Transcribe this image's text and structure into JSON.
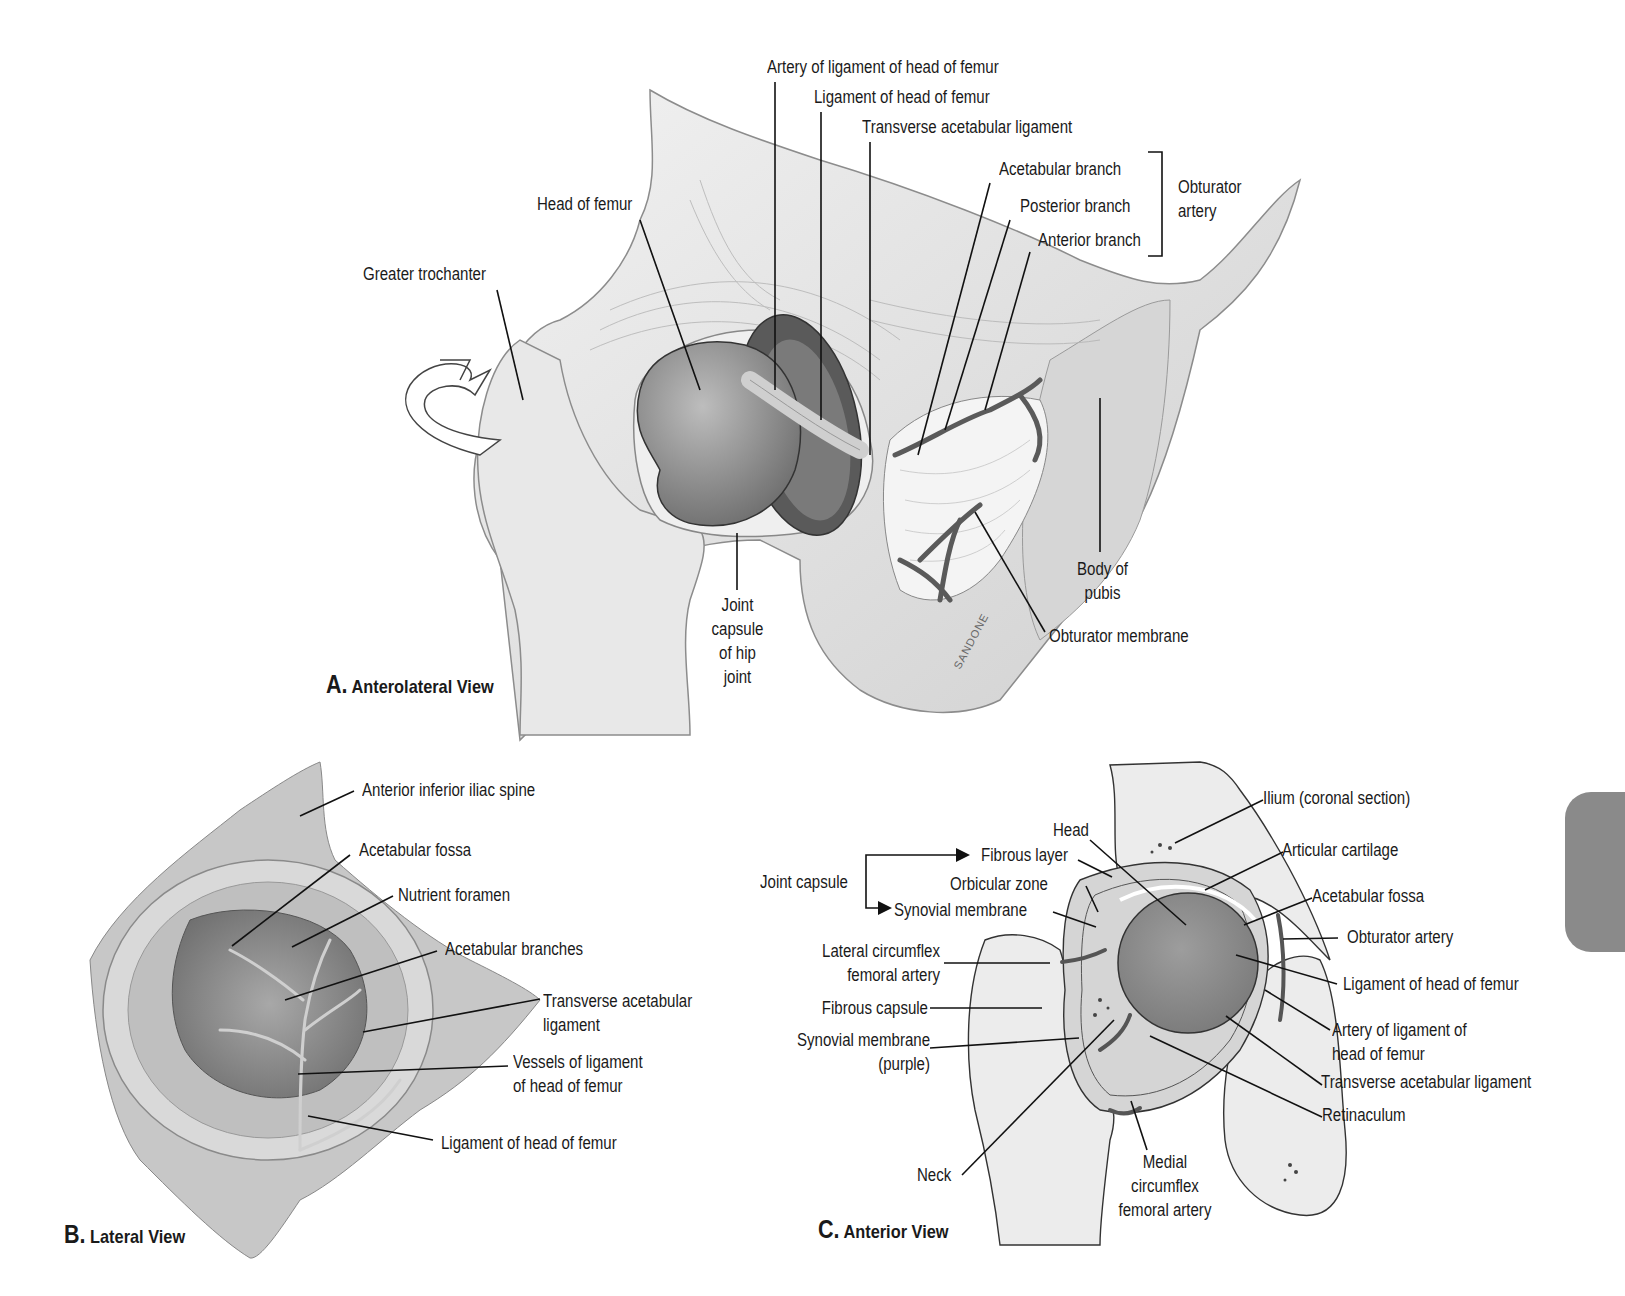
{
  "figure": {
    "panels": [
      {
        "id": "A",
        "title_letter": "A.",
        "title_text": "Anterolateral View",
        "labels": {
          "artery_ligament_head": "Artery of ligament of head of femur",
          "ligament_head": "Ligament of head of femur",
          "transverse_acetabular": "Transverse acetabular ligament",
          "acetabular_branch": "Acetabular branch",
          "posterior_branch": "Posterior branch",
          "anterior_branch": "Anterior branch",
          "obturator_artery": "Obturator\nartery",
          "head_of_femur": "Head of femur",
          "greater_trochanter": "Greater trochanter",
          "joint_capsule": "Joint\ncapsule\nof hip\njoint",
          "body_of_pubis": "Body of\npubis",
          "obturator_membrane": "Obturator membrane",
          "signature": "SANDONE"
        }
      },
      {
        "id": "B",
        "title_letter": "B.",
        "title_text": "Lateral View",
        "labels": {
          "anterior_inferior_iliac_spine": "Anterior inferior iliac spine",
          "acetabular_fossa": "Acetabular fossa",
          "nutrient_foramen": "Nutrient foramen",
          "acetabular_branches": "Acetabular branches",
          "transverse_acetabular": "Transverse acetabular\nligament",
          "vessels_ligament": "Vessels of ligament\nof head of femur",
          "ligament_head": "Ligament of head of femur"
        }
      },
      {
        "id": "C",
        "title_letter": "C.",
        "title_text": "Anterior View",
        "labels": {
          "joint_capsule": "Joint capsule",
          "head": "Head",
          "fibrous_layer": "Fibrous layer",
          "orbicular_zone": "Orbicular zone",
          "synovial_membrane": "Synovial membrane",
          "lateral_circumflex": "Lateral circumflex\nfemoral artery",
          "fibrous_capsule": "Fibrous capsule",
          "synovial_purple": "Synovial membrane\n(purple)",
          "neck": "Neck",
          "medial_circumflex": "Medial\ncircumflex\nfemoral artery",
          "ilium": "Ilium (coronal section)",
          "articular_cartilage": "Articular cartilage",
          "acetabular_fossa": "Acetabular fossa",
          "obturator_artery": "Obturator artery",
          "ligament_head": "Ligament of head of femur",
          "artery_ligament_head": "Artery of ligament of\nhead of femur",
          "transverse_acetabular": "Transverse acetabular ligament",
          "retinaculum": "Retinaculum"
        }
      }
    ],
    "colors": {
      "ink": "#1a1a1a",
      "bone_light": "#e6e6e6",
      "bone_mid": "#c8c8c8",
      "bone_dark": "#9a9a9a",
      "side_tab": "#8a8a8a"
    }
  }
}
